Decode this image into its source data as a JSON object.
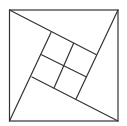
{
  "diagram": {
    "stroke_color": "#333333",
    "background": "#ffffff",
    "outer_square": {
      "tl": [
        9.5,
        10
      ],
      "tr": [
        118,
        10
      ],
      "br": [
        118,
        121
      ],
      "bl": [
        9.5,
        121
      ]
    },
    "inner_square": {
      "top": [
        51,
        32.5
      ],
      "right": [
        96,
        54.5
      ],
      "bottom": [
        76,
        99
      ],
      "left": [
        32,
        77
      ]
    },
    "pinwheel_lines": [
      {
        "from": [
          9.5,
          10
        ],
        "to": [
          96,
          54.5
        ]
      },
      {
        "from": [
          118,
          10
        ],
        "to": [
          76,
          99
        ]
      },
      {
        "from": [
          118,
          121
        ],
        "to": [
          32,
          77
        ]
      },
      {
        "from": [
          9.5,
          121
        ],
        "to": [
          51,
          32.5
        ]
      }
    ],
    "inner_dividers": [
      {
        "from": [
          41.5,
          54.75
        ],
        "to": [
          86,
          76.75
        ]
      },
      {
        "from": [
          73.5,
          43.5
        ],
        "to": [
          54,
          88
        ]
      }
    ]
  }
}
